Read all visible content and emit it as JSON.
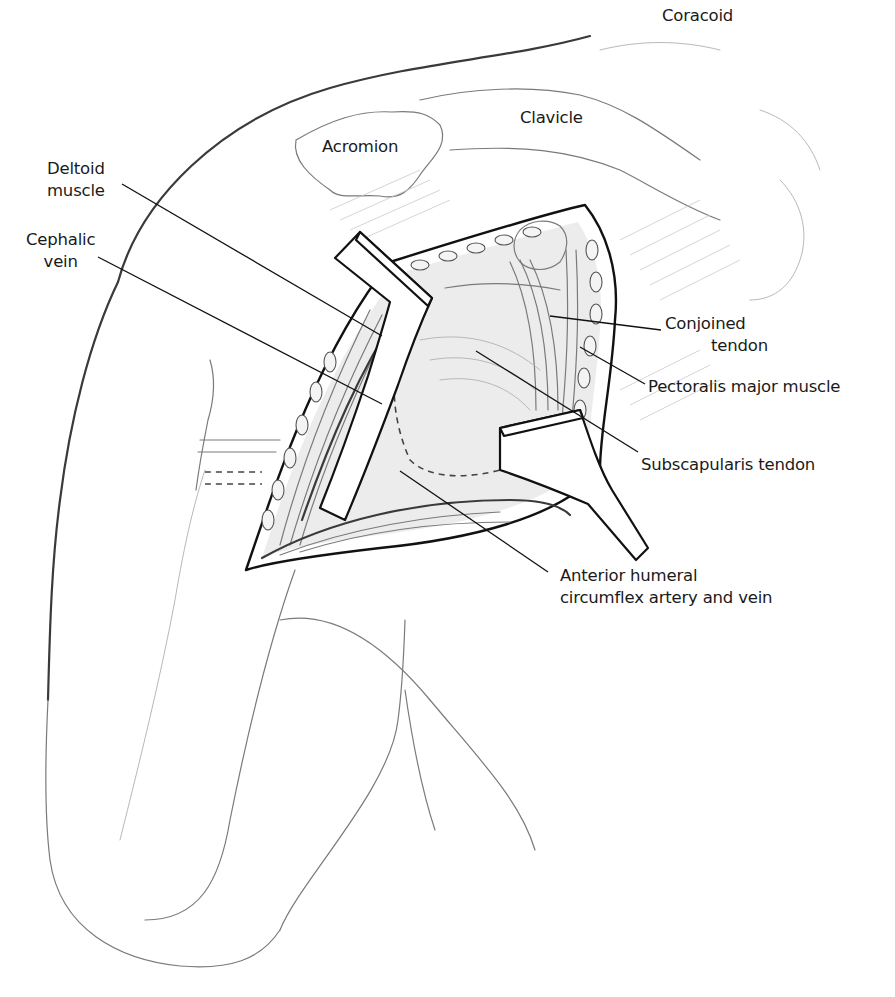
{
  "figure": {
    "colors": {
      "ink": "#111111",
      "sketch": "#7a7a7a",
      "background": "#ffffff"
    }
  },
  "labels": {
    "coracoid": {
      "lines": [
        "Coracoid"
      ]
    },
    "clavicle": {
      "lines": [
        "Clavicle"
      ]
    },
    "acromion": {
      "lines": [
        "Acromion"
      ]
    },
    "deltoid": {
      "lines": [
        "Deltoid",
        "muscle"
      ]
    },
    "cephalic": {
      "lines": [
        "Cephalic",
        "vein"
      ]
    },
    "conjoined": {
      "lines": [
        "Conjoined",
        "tendon"
      ]
    },
    "pectoralis": {
      "lines": [
        "Pectoralis major muscle"
      ]
    },
    "subscapularis": {
      "lines": [
        "Subscapularis tendon"
      ]
    },
    "circumflex": {
      "lines": [
        "Anterior humeral",
        "circumflex artery and vein"
      ]
    }
  }
}
